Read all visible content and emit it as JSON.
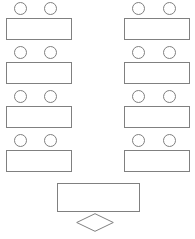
{
  "diagram": {
    "background_color": "#ffffff",
    "line_color": "#808080",
    "fill_color": "#ffffff",
    "type": "seating-plan"
  },
  "student_desks": [
    {
      "id": "desk-left-row1",
      "label": "",
      "column": "left",
      "row": 1,
      "x": 6,
      "y": 18,
      "width": 66,
      "height": 22,
      "seats": [
        {
          "id": "seat-left-row1-a",
          "label": "",
          "x": 14,
          "y": 2,
          "size": 13
        },
        {
          "id": "seat-left-row1-b",
          "label": "",
          "x": 44,
          "y": 2,
          "size": 13
        }
      ]
    },
    {
      "id": "desk-right-row1",
      "label": "",
      "column": "right",
      "row": 1,
      "x": 124,
      "y": 18,
      "width": 66,
      "height": 22,
      "seats": [
        {
          "id": "seat-right-row1-a",
          "label": "",
          "x": 132,
          "y": 2,
          "size": 13
        },
        {
          "id": "seat-right-row1-b",
          "label": "",
          "x": 163,
          "y": 2,
          "size": 13
        }
      ]
    },
    {
      "id": "desk-left-row2",
      "label": "",
      "column": "left",
      "row": 2,
      "x": 6,
      "y": 62,
      "width": 66,
      "height": 22,
      "seats": [
        {
          "id": "seat-left-row2-a",
          "label": "",
          "x": 14,
          "y": 46,
          "size": 13
        },
        {
          "id": "seat-left-row2-b",
          "label": "",
          "x": 44,
          "y": 46,
          "size": 13
        }
      ]
    },
    {
      "id": "desk-right-row2",
      "label": "",
      "column": "right",
      "row": 2,
      "x": 124,
      "y": 62,
      "width": 66,
      "height": 22,
      "seats": [
        {
          "id": "seat-right-row2-a",
          "label": "",
          "x": 132,
          "y": 46,
          "size": 13
        },
        {
          "id": "seat-right-row2-b",
          "label": "",
          "x": 163,
          "y": 46,
          "size": 13
        }
      ]
    },
    {
      "id": "desk-left-row3",
      "label": "",
      "column": "left",
      "row": 3,
      "x": 6,
      "y": 106,
      "width": 66,
      "height": 22,
      "seats": [
        {
          "id": "seat-left-row3-a",
          "label": "",
          "x": 14,
          "y": 90,
          "size": 13
        },
        {
          "id": "seat-left-row3-b",
          "label": "",
          "x": 44,
          "y": 90,
          "size": 13
        }
      ]
    },
    {
      "id": "desk-right-row3",
      "label": "",
      "column": "right",
      "row": 3,
      "x": 124,
      "y": 106,
      "width": 66,
      "height": 22,
      "seats": [
        {
          "id": "seat-right-row3-a",
          "label": "",
          "x": 132,
          "y": 90,
          "size": 13
        },
        {
          "id": "seat-right-row3-b",
          "label": "",
          "x": 163,
          "y": 90,
          "size": 13
        }
      ]
    },
    {
      "id": "desk-left-row4",
      "label": "",
      "column": "left",
      "row": 4,
      "x": 6,
      "y": 150,
      "width": 66,
      "height": 22,
      "seats": [
        {
          "id": "seat-left-row4-a",
          "label": "",
          "x": 14,
          "y": 134,
          "size": 13
        },
        {
          "id": "seat-left-row4-b",
          "label": "",
          "x": 44,
          "y": 134,
          "size": 13
        }
      ]
    },
    {
      "id": "desk-right-row4",
      "label": "",
      "column": "right",
      "row": 4,
      "x": 124,
      "y": 150,
      "width": 66,
      "height": 22,
      "seats": [
        {
          "id": "seat-right-row4-a",
          "label": "",
          "x": 132,
          "y": 134,
          "size": 13
        },
        {
          "id": "seat-right-row4-b",
          "label": "",
          "x": 163,
          "y": 134,
          "size": 13
        }
      ]
    }
  ],
  "teacher_desk": {
    "id": "teacher-desk",
    "label": "",
    "x": 57,
    "y": 183,
    "width": 83,
    "height": 29
  },
  "podium": {
    "id": "podium",
    "label": "",
    "x": 76,
    "y": 213,
    "width": 38,
    "height": 19
  },
  "counts": {
    "desks": 8,
    "seats": 16,
    "rows": 4,
    "columns": 2
  }
}
